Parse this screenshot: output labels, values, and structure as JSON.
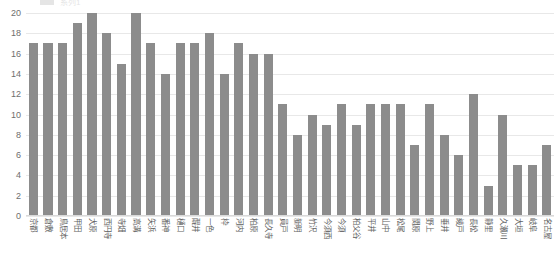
{
  "legend": {
    "swatch_color": "#8c8c8c",
    "label": "系列1"
  },
  "chart_data": {
    "type": "bar",
    "title": "",
    "xlabel": "",
    "ylabel": "",
    "ylim": [
      0,
      20
    ],
    "ytick_step": 2,
    "grid": true,
    "legend_position": "top",
    "bar_color": "#8c8c8c",
    "gridline_color": "#e8e8e8",
    "yticks": [
      0,
      2,
      4,
      6,
      8,
      10,
      12,
      14,
      16,
      18,
      20
    ],
    "categories": [
      "京都",
      "倉敷",
      "鳥居本",
      "甲田",
      "犬原",
      "西円寺",
      "寺畑",
      "高溝",
      "矢浜",
      "番神",
      "樋口",
      "醍井",
      "一色",
      "枠",
      "河内",
      "柏原",
      "長久寺",
      "員戸",
      "新明",
      "竹沢",
      "今須西",
      "今須",
      "柏父谷",
      "平井",
      "山中",
      "松尾",
      "関原",
      "野上",
      "垂井",
      "綾戸",
      "長松",
      "静里",
      "久瀬川",
      "大垣",
      "岐阜",
      "名古屋"
    ],
    "values": [
      17,
      17,
      17,
      19,
      20,
      18,
      15,
      20,
      17,
      14,
      17,
      17,
      18,
      14,
      17,
      16,
      16,
      11,
      8,
      10,
      9,
      11,
      9,
      11,
      11,
      11,
      7,
      11,
      8,
      6,
      12,
      3,
      10,
      5,
      5,
      7
    ]
  }
}
